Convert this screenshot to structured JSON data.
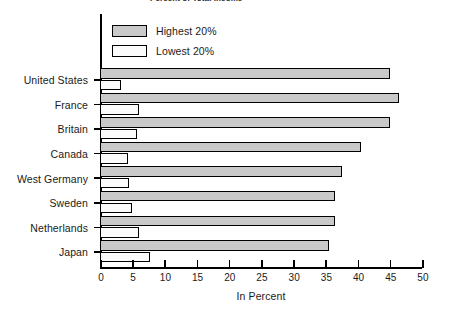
{
  "chart_data": {
    "type": "bar",
    "orientation": "horizontal",
    "title": "Percent of Total Income",
    "xlabel": "In Percent",
    "ylabel": "",
    "xlim": [
      0,
      50
    ],
    "xticks": [
      0,
      5,
      10,
      15,
      20,
      25,
      30,
      35,
      40,
      45,
      50
    ],
    "grid": false,
    "legend_position": "top-left",
    "categories": [
      "United States",
      "France",
      "Britain",
      "Canada",
      "West Germany",
      "Sweden",
      "Netherlands",
      "Japan"
    ],
    "series": [
      {
        "name": "Highest 20%",
        "color": "#c9c9c9",
        "values": [
          45.0,
          46.5,
          45.0,
          40.5,
          37.5,
          36.5,
          36.5,
          35.5
        ]
      },
      {
        "name": "Lowest 20%",
        "color": "#fbfbfb",
        "values": [
          3.3,
          6.1,
          5.8,
          4.3,
          4.5,
          5.0,
          6.0,
          7.7
        ]
      }
    ]
  },
  "legend": {
    "items": [
      {
        "label": "Highest 20%",
        "swatch": "highest"
      },
      {
        "label": "Lowest 20%",
        "swatch": "lowest"
      }
    ]
  }
}
